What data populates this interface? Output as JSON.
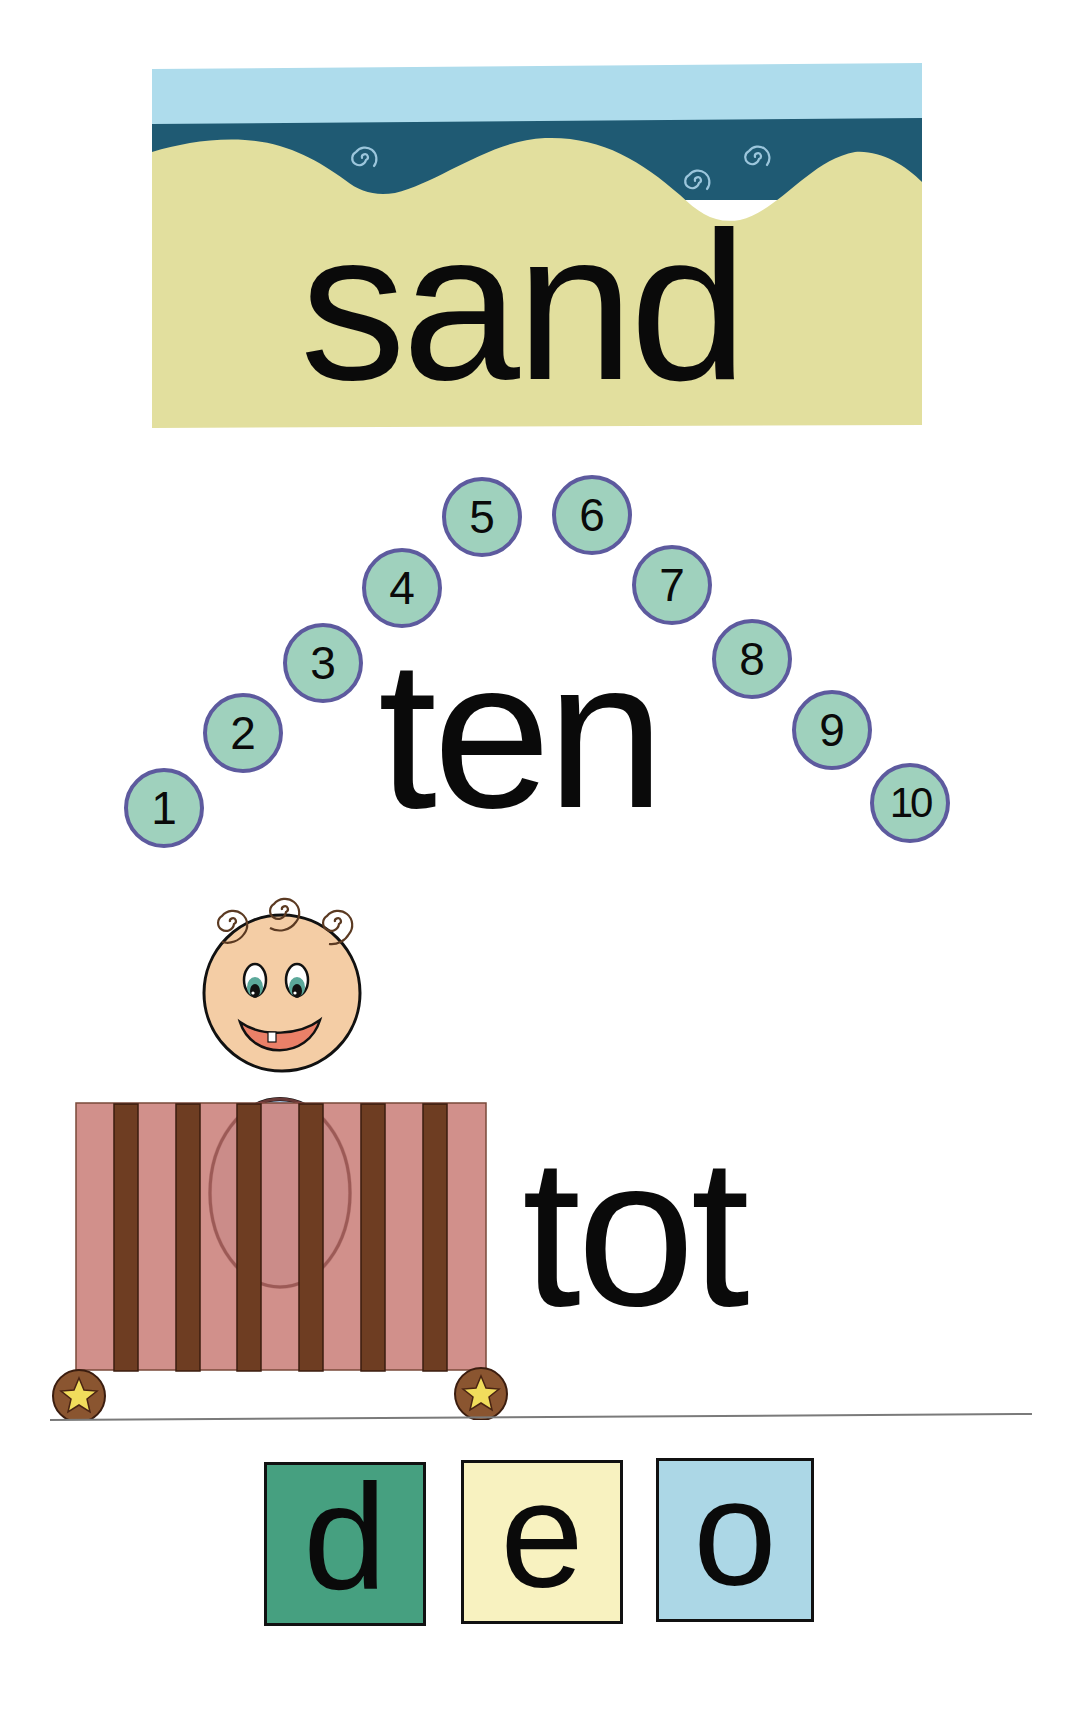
{
  "page": {
    "background": "#ffffff"
  },
  "cards": {
    "sand": {
      "word": "sand",
      "picture": "beach-scene",
      "colors": {
        "sky": "#aedcec",
        "water": "#1f5a73",
        "sand": "#e2df9e",
        "swirl": "#9cc6dc"
      }
    },
    "ten": {
      "word": "ten",
      "picture": "numbered-circles-arc",
      "numbers": [
        "1",
        "2",
        "3",
        "4",
        "5",
        "6",
        "7",
        "8",
        "9",
        "10"
      ],
      "colors": {
        "circle_fill": "#9fd1bd",
        "circle_border": "#5d5a9e"
      }
    },
    "tot": {
      "word": "tot",
      "picture": "toddler-in-crib",
      "colors": {
        "crib": "#cd8882",
        "bars": "#6e3d22",
        "skin": "#f4cda5",
        "shirt": "#a9c3e3",
        "mouth": "#ea8068",
        "wheel": "#8a5530",
        "star": "#f1dd5c"
      }
    }
  },
  "letter_tiles": [
    {
      "letter": "d",
      "color": "#46a080"
    },
    {
      "letter": "e",
      "color": "#f8f2c0"
    },
    {
      "letter": "o",
      "color": "#acd7e6"
    }
  ]
}
